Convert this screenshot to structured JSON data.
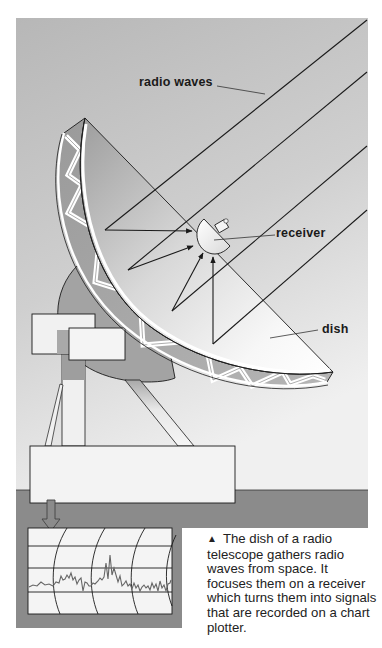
{
  "labels": {
    "radio_waves": "radio waves",
    "receiver": "receiver",
    "dish": "dish"
  },
  "caption": {
    "marker": "▲",
    "text": "The dish of a radio telescope gathers radio waves from space. It focuses them on a receiver which turns them into signals that are recorded on a chart plotter."
  },
  "colors": {
    "sky_top": "#b9b9b9",
    "sky_bottom": "#eeeeee",
    "ground": "#8a8a8a",
    "dish_shadow": "#9a9a9a",
    "outline": "#1a1a1a",
    "paper": "#f2f2f2"
  }
}
